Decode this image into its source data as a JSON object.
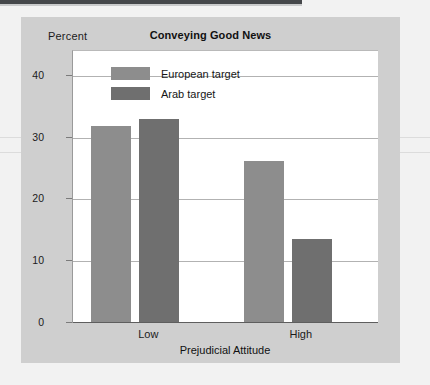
{
  "figure": {
    "y_unit_label": "Percent"
  },
  "chart_data": {
    "type": "bar",
    "title": "Conveying Good News",
    "xlabel": "Prejudicial Attitude",
    "ylabel": "Percent",
    "categories": [
      "Low",
      "High"
    ],
    "series": [
      {
        "name": "European target",
        "color": "#8d8d8d",
        "values": [
          31.7,
          26.0
        ]
      },
      {
        "name": "Arab target",
        "color": "#6f6f6f",
        "values": [
          32.8,
          13.5
        ]
      }
    ],
    "ylim": [
      0,
      44
    ],
    "yticks": [
      0,
      10,
      20,
      30,
      40
    ],
    "ytick_labels": [
      "0",
      "10",
      "20",
      "30",
      "40"
    ],
    "grid": true,
    "legend_position": "top-left-inside"
  }
}
